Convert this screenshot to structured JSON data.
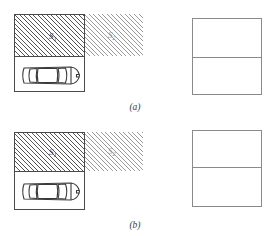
{
  "figure": {
    "type": "technical-diagram",
    "panels": [
      {
        "id": "a",
        "caption": "(a)",
        "caption_letter": "a",
        "left_diagram": {
          "name": "parking-bay-with-shadow-zones",
          "bay_box": {
            "x": 14,
            "y": 14,
            "width": 71,
            "height": 78
          },
          "zones": [
            {
              "id": "S1",
              "label": "S",
              "subscript": "1",
              "hatch": "dense-diagonal-45",
              "hatch_color": "#555555",
              "x": 14,
              "y": 14,
              "width": 71,
              "height": 42,
              "label_x": 48,
              "label_y": 31
            },
            {
              "id": "S2",
              "label": "S",
              "subscript": "2",
              "hatch": "light-diagonal-45",
              "hatch_color": "#9a9a9a",
              "x": 85,
              "y": 14,
              "width": 58,
              "height": 42,
              "label_x": 108,
              "label_y": 31
            }
          ],
          "car": {
            "name": "car-top-view",
            "orientation": "horizontal",
            "x": 18,
            "y": 60,
            "width": 63,
            "height": 29,
            "stroke": "#3a3a3a"
          }
        },
        "right_square": {
          "name": "split-square",
          "x": 192,
          "y": 18,
          "width": 70,
          "height": 77,
          "divider_offset": 38,
          "divider_label": "",
          "rows": 2
        }
      },
      {
        "id": "b",
        "caption": "(b)",
        "caption_letter": "b",
        "left_diagram": {
          "name": "parking-bay-with-shadow-zones",
          "bay_box": {
            "x": 14,
            "y": 132,
            "width": 71,
            "height": 78
          },
          "zones": [
            {
              "id": "S1",
              "label": "S",
              "subscript": "1",
              "hatch": "dense-diagonal-45",
              "hatch_color": "#555555",
              "x": 14,
              "y": 132,
              "width": 71,
              "height": 39,
              "label_x": 48,
              "label_y": 147
            },
            {
              "id": "S2",
              "label": "S",
              "subscript": "2",
              "hatch": "light-diagonal-45",
              "hatch_color": "#9a9a9a",
              "x": 85,
              "y": 132,
              "width": 58,
              "height": 39,
              "label_x": 108,
              "label_y": 147
            }
          ],
          "car": {
            "name": "car-top-view",
            "orientation": "horizontal",
            "x": 18,
            "y": 175,
            "width": 63,
            "height": 31,
            "stroke": "#3a3a3a"
          }
        },
        "right_square": {
          "name": "split-square",
          "x": 192,
          "y": 130,
          "width": 70,
          "height": 77,
          "divider_offset": 36,
          "divider_label": "",
          "rows": 2
        }
      }
    ]
  },
  "colors": {
    "background": "#ffffff",
    "outline": "#4a4a4a",
    "square_outline": "#8a8a8a",
    "hatch_dark": "#555555",
    "hatch_light": "#9a9a9a",
    "text": "#3c3c3c"
  }
}
